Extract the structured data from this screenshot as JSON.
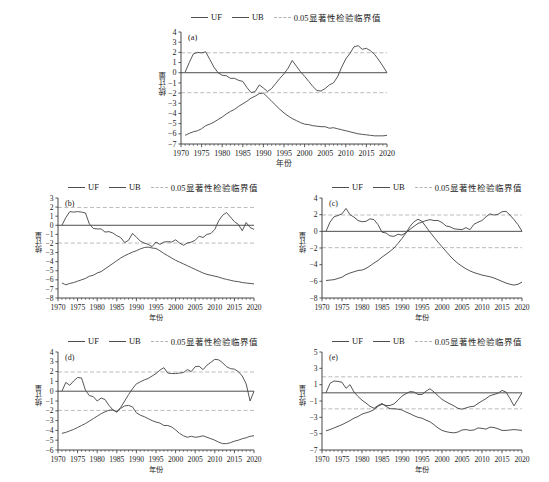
{
  "figure": {
    "ylabel": "统计量",
    "xlabel": "年份",
    "legend": {
      "uf": "UF",
      "ub": "UB",
      "critical": "0.05显著性检验临界值"
    },
    "colors": {
      "line": "#4d4d4d",
      "critical": "#b3b3b3",
      "axis": "#333333"
    }
  },
  "chart_data": [
    {
      "type": "line",
      "title": "(a)",
      "xlabel": "年份",
      "ylabel": "统计量",
      "xlim": [
        1970,
        2020
      ],
      "ylim": [
        -7,
        4
      ],
      "xticks": [
        1970,
        1975,
        1980,
        1985,
        1990,
        1995,
        2000,
        2005,
        2010,
        2015,
        2020
      ],
      "yticks": [
        4,
        3,
        2,
        1,
        0,
        -1,
        -2,
        -3,
        -4,
        -5,
        -6,
        -7
      ],
      "grid": false,
      "legend_position": "top",
      "annotations": [
        "0.05 significance critical lines at +1.96 and -1.96"
      ],
      "critical_values": [
        1.96,
        -1.96
      ],
      "x": [
        1971,
        1972,
        1973,
        1974,
        1975,
        1976,
        1977,
        1978,
        1979,
        1980,
        1981,
        1982,
        1983,
        1984,
        1985,
        1986,
        1987,
        1988,
        1989,
        1990,
        1991,
        1992,
        1993,
        1994,
        1995,
        1996,
        1997,
        1998,
        1999,
        2000,
        2001,
        2002,
        2003,
        2004,
        2005,
        2006,
        2007,
        2008,
        2009,
        2010,
        2011,
        2012,
        2013,
        2014,
        2015,
        2016,
        2017,
        2018,
        2019,
        2020
      ],
      "series": [
        {
          "name": "UF",
          "values": [
            0.05,
            1.0,
            1.85,
            2.0,
            1.95,
            2.05,
            1.3,
            0.55,
            0.0,
            -0.25,
            -0.3,
            -0.55,
            -0.55,
            -0.75,
            -0.85,
            -1.45,
            -1.95,
            -1.85,
            -1.2,
            -1.5,
            -1.85,
            -1.55,
            -1.05,
            -0.55,
            -0.1,
            0.45,
            1.2,
            0.65,
            0.1,
            -0.35,
            -0.85,
            -1.35,
            -1.75,
            -1.8,
            -1.55,
            -1.2,
            -1.0,
            -0.4,
            0.55,
            1.35,
            1.9,
            2.55,
            2.65,
            2.3,
            2.4,
            2.15,
            1.8,
            1.25,
            0.65,
            0.0
          ]
        },
        {
          "name": "UB",
          "values": [
            -6.15,
            -5.95,
            -5.8,
            -5.7,
            -5.5,
            -5.2,
            -5.05,
            -4.85,
            -4.6,
            -4.35,
            -4.05,
            -3.8,
            -3.6,
            -3.3,
            -3.05,
            -2.8,
            -2.5,
            -2.3,
            -2.05,
            -2.0,
            -2.4,
            -2.8,
            -3.2,
            -3.6,
            -3.95,
            -4.25,
            -4.5,
            -4.7,
            -4.9,
            -5.05,
            -5.1,
            -5.2,
            -5.25,
            -5.3,
            -5.3,
            -5.45,
            -5.4,
            -5.5,
            -5.6,
            -5.7,
            -5.8,
            -5.9,
            -6.0,
            -6.05,
            -6.1,
            -6.15,
            -6.2,
            -6.2,
            -6.2,
            -6.15
          ]
        }
      ]
    },
    {
      "type": "line",
      "title": "(b)",
      "xlabel": "年份",
      "ylabel": "统计量",
      "xlim": [
        1970,
        2020
      ],
      "ylim": [
        -8,
        3
      ],
      "xticks": [
        1970,
        1975,
        1980,
        1985,
        1990,
        1995,
        2000,
        2005,
        2010,
        2015,
        2020
      ],
      "yticks": [
        3,
        2,
        1,
        0,
        -1,
        -2,
        -3,
        -4,
        -5,
        -6,
        -7,
        -8
      ],
      "grid": false,
      "legend_position": "top",
      "critical_values": [
        1.96,
        -1.96
      ],
      "x": [
        1971,
        1972,
        1973,
        1974,
        1975,
        1976,
        1977,
        1978,
        1979,
        1980,
        1981,
        1982,
        1983,
        1984,
        1985,
        1986,
        1987,
        1988,
        1989,
        1990,
        1991,
        1992,
        1993,
        1994,
        1995,
        1996,
        1997,
        1998,
        1999,
        2000,
        2001,
        2002,
        2003,
        2004,
        2005,
        2006,
        2007,
        2008,
        2009,
        2010,
        2011,
        2012,
        2013,
        2014,
        2015,
        2016,
        2017,
        2018,
        2019,
        2020
      ],
      "series": [
        {
          "name": "UF",
          "values": [
            0.0,
            0.85,
            1.5,
            1.45,
            1.5,
            1.45,
            1.35,
            0.15,
            -0.35,
            -0.4,
            -0.4,
            -0.75,
            -0.7,
            -0.85,
            -1.15,
            -1.35,
            -1.9,
            -1.65,
            -0.9,
            -1.3,
            -1.75,
            -1.95,
            -2.1,
            -2.35,
            -1.85,
            -2.1,
            -1.85,
            -1.8,
            -1.85,
            -1.6,
            -1.95,
            -2.2,
            -1.95,
            -1.85,
            -1.65,
            -1.2,
            -1.35,
            -1.0,
            -0.9,
            -0.45,
            0.5,
            1.1,
            1.4,
            0.9,
            0.4,
            0.1,
            -0.6,
            0.3,
            -0.25,
            -0.45
          ]
        },
        {
          "name": "UB",
          "values": [
            -6.35,
            -6.55,
            -6.4,
            -6.3,
            -6.15,
            -6.0,
            -5.85,
            -5.6,
            -5.5,
            -5.25,
            -5.1,
            -4.8,
            -4.5,
            -4.2,
            -3.9,
            -3.6,
            -3.35,
            -3.15,
            -2.95,
            -2.8,
            -2.6,
            -2.45,
            -2.4,
            -2.5,
            -2.55,
            -2.8,
            -3.1,
            -3.35,
            -3.6,
            -3.85,
            -4.05,
            -4.25,
            -4.45,
            -4.65,
            -4.85,
            -5.05,
            -5.25,
            -5.4,
            -5.5,
            -5.6,
            -5.7,
            -5.85,
            -5.95,
            -6.05,
            -6.15,
            -6.2,
            -6.3,
            -6.35,
            -6.4,
            -6.45
          ]
        }
      ]
    },
    {
      "type": "line",
      "title": "(c)",
      "xlabel": "年份",
      "ylabel": "统计量",
      "xlim": [
        1970,
        2020
      ],
      "ylim": [
        -8,
        4
      ],
      "xticks": [
        1970,
        1975,
        1980,
        1985,
        1990,
        1995,
        2000,
        2005,
        2010,
        2015,
        2020
      ],
      "yticks": [
        4,
        2,
        0,
        -2,
        -4,
        -6,
        -8
      ],
      "grid": false,
      "legend_position": "top",
      "critical_values": [
        1.96,
        -1.96
      ],
      "x": [
        1971,
        1972,
        1973,
        1974,
        1975,
        1976,
        1977,
        1978,
        1979,
        1980,
        1981,
        1982,
        1983,
        1984,
        1985,
        1986,
        1987,
        1988,
        1989,
        1990,
        1991,
        1992,
        1993,
        1994,
        1995,
        1996,
        1997,
        1998,
        1999,
        2000,
        2001,
        2002,
        2003,
        2004,
        2005,
        2006,
        2007,
        2008,
        2009,
        2010,
        2011,
        2012,
        2013,
        2014,
        2015,
        2016,
        2017,
        2018,
        2019,
        2020
      ],
      "series": [
        {
          "name": "UF",
          "values": [
            0.0,
            1.1,
            1.75,
            1.9,
            2.1,
            2.75,
            2.0,
            1.7,
            1.3,
            1.15,
            1.2,
            1.5,
            1.4,
            0.8,
            -0.1,
            -0.2,
            -0.55,
            -0.6,
            -0.35,
            -0.45,
            -0.15,
            0.25,
            0.6,
            0.95,
            1.1,
            1.3,
            1.4,
            1.3,
            1.3,
            1.05,
            0.65,
            0.55,
            0.3,
            0.25,
            0.2,
            0.45,
            0.2,
            0.85,
            1.1,
            1.3,
            1.75,
            2.1,
            1.95,
            2.05,
            2.35,
            2.4,
            1.95,
            1.4,
            0.8,
            0.0
          ]
        },
        {
          "name": "UB",
          "values": [
            -5.9,
            -5.85,
            -5.8,
            -5.65,
            -5.5,
            -5.2,
            -5.0,
            -4.85,
            -4.7,
            -4.65,
            -4.45,
            -4.15,
            -3.8,
            -3.5,
            -3.1,
            -2.75,
            -2.4,
            -2.0,
            -1.45,
            -0.85,
            -0.2,
            0.6,
            1.15,
            1.45,
            1.2,
            0.55,
            -0.1,
            -0.7,
            -1.3,
            -1.85,
            -2.4,
            -2.95,
            -3.45,
            -3.85,
            -4.2,
            -4.5,
            -4.75,
            -4.95,
            -5.1,
            -5.25,
            -5.35,
            -5.45,
            -5.6,
            -5.8,
            -6.0,
            -6.2,
            -6.35,
            -6.45,
            -6.35,
            -6.1
          ]
        }
      ]
    },
    {
      "type": "line",
      "title": "(d)",
      "xlabel": "年份",
      "ylabel": "统计量",
      "xlim": [
        1970,
        2020
      ],
      "ylim": [
        -6,
        4
      ],
      "xticks": [
        1970,
        1975,
        1980,
        1985,
        1990,
        1995,
        2000,
        2005,
        2010,
        2015,
        2020
      ],
      "yticks": [
        4,
        3,
        2,
        1,
        0,
        -1,
        -2,
        -3,
        -4,
        -5,
        -6
      ],
      "grid": false,
      "legend_position": "top",
      "critical_values": [
        1.96,
        -1.96
      ],
      "x": [
        1971,
        1972,
        1973,
        1974,
        1975,
        1976,
        1977,
        1978,
        1979,
        1980,
        1981,
        1982,
        1983,
        1984,
        1985,
        1986,
        1987,
        1988,
        1989,
        1990,
        1991,
        1992,
        1993,
        1994,
        1995,
        1996,
        1997,
        1998,
        1999,
        2000,
        2001,
        2002,
        2003,
        2004,
        2005,
        2006,
        2007,
        2008,
        2009,
        2010,
        2011,
        2012,
        2013,
        2014,
        2015,
        2016,
        2017,
        2018,
        2019,
        2020
      ],
      "series": [
        {
          "name": "UF",
          "values": [
            0.0,
            0.9,
            0.6,
            1.05,
            1.4,
            1.35,
            0.1,
            -0.45,
            -0.55,
            -1.0,
            -0.7,
            -0.85,
            -1.45,
            -1.9,
            -2.15,
            -1.75,
            -1.5,
            -1.45,
            -1.6,
            -2.2,
            -2.45,
            -2.6,
            -2.8,
            -3.0,
            -3.15,
            -3.25,
            -3.5,
            -3.5,
            -3.65,
            -3.95,
            -4.3,
            -4.55,
            -4.7,
            -4.6,
            -4.7,
            -4.65,
            -4.55,
            -4.7,
            -4.85,
            -5.0,
            -5.2,
            -5.35,
            -5.35,
            -5.25,
            -5.1,
            -5.0,
            -4.85,
            -4.75,
            -4.6,
            -4.55
          ]
        },
        {
          "name": "UB",
          "values": [
            -4.3,
            -4.2,
            -4.05,
            -3.9,
            -3.7,
            -3.5,
            -3.3,
            -3.05,
            -2.8,
            -2.55,
            -2.3,
            -2.1,
            -1.95,
            -1.9,
            -2.1,
            -1.65,
            -1.0,
            -0.35,
            0.25,
            0.75,
            0.95,
            1.15,
            1.3,
            1.55,
            1.8,
            2.15,
            2.4,
            1.85,
            1.8,
            1.8,
            1.85,
            1.9,
            2.2,
            2.0,
            2.5,
            2.55,
            2.2,
            2.65,
            2.95,
            3.25,
            3.2,
            2.9,
            2.5,
            2.3,
            2.25,
            2.0,
            1.55,
            0.75,
            -1.0,
            0.0
          ]
        }
      ]
    },
    {
      "type": "line",
      "title": "(e)",
      "xlabel": "年份",
      "ylabel": "统计量",
      "xlim": [
        1970,
        2020
      ],
      "ylim": [
        -7,
        5
      ],
      "xticks": [
        1970,
        1975,
        1980,
        1985,
        1990,
        1995,
        2000,
        2005,
        2010,
        2015,
        2020
      ],
      "yticks": [
        5,
        3,
        1,
        -1,
        -3,
        -5,
        -7
      ],
      "grid": false,
      "legend_position": "top",
      "critical_values": [
        1.96,
        -1.96
      ],
      "x": [
        1971,
        1972,
        1973,
        1974,
        1975,
        1976,
        1977,
        1978,
        1979,
        1980,
        1981,
        1982,
        1983,
        1984,
        1985,
        1986,
        1987,
        1988,
        1989,
        1990,
        1991,
        1992,
        1993,
        1994,
        1995,
        1996,
        1997,
        1998,
        1999,
        2000,
        2001,
        2002,
        2003,
        2004,
        2005,
        2006,
        2007,
        2008,
        2009,
        2010,
        2011,
        2012,
        2013,
        2014,
        2015,
        2016,
        2017,
        2018,
        2019,
        2020
      ],
      "series": [
        {
          "name": "UF",
          "values": [
            0.0,
            1.15,
            1.45,
            1.4,
            1.3,
            0.55,
            1.0,
            0.1,
            -0.45,
            -0.9,
            -1.25,
            -1.65,
            -1.9,
            -1.55,
            -1.3,
            -1.65,
            -1.95,
            -1.95,
            -2.0,
            -2.1,
            -2.35,
            -2.55,
            -2.8,
            -3.0,
            -3.1,
            -3.35,
            -3.55,
            -3.9,
            -4.3,
            -4.6,
            -4.75,
            -4.85,
            -4.9,
            -4.8,
            -4.55,
            -4.5,
            -4.6,
            -4.55,
            -4.3,
            -4.35,
            -4.45,
            -4.2,
            -4.25,
            -4.4,
            -4.6,
            -4.6,
            -4.55,
            -4.5,
            -4.55,
            -4.6
          ]
        },
        {
          "name": "UB",
          "values": [
            -4.65,
            -4.5,
            -4.3,
            -4.1,
            -3.9,
            -3.65,
            -3.4,
            -3.1,
            -2.9,
            -2.6,
            -2.45,
            -2.3,
            -2.05,
            -1.65,
            -1.4,
            -1.55,
            -1.55,
            -1.35,
            -0.9,
            -0.4,
            -0.1,
            0.15,
            0.1,
            -0.2,
            -0.2,
            0.2,
            0.5,
            0.1,
            -0.35,
            -0.8,
            -1.1,
            -1.35,
            -1.6,
            -1.9,
            -2.0,
            -1.85,
            -1.7,
            -1.65,
            -1.3,
            -1.0,
            -0.7,
            -0.35,
            -0.2,
            -0.05,
            0.3,
            0.1,
            -0.7,
            -1.6,
            -0.8,
            0.0
          ]
        }
      ]
    }
  ]
}
